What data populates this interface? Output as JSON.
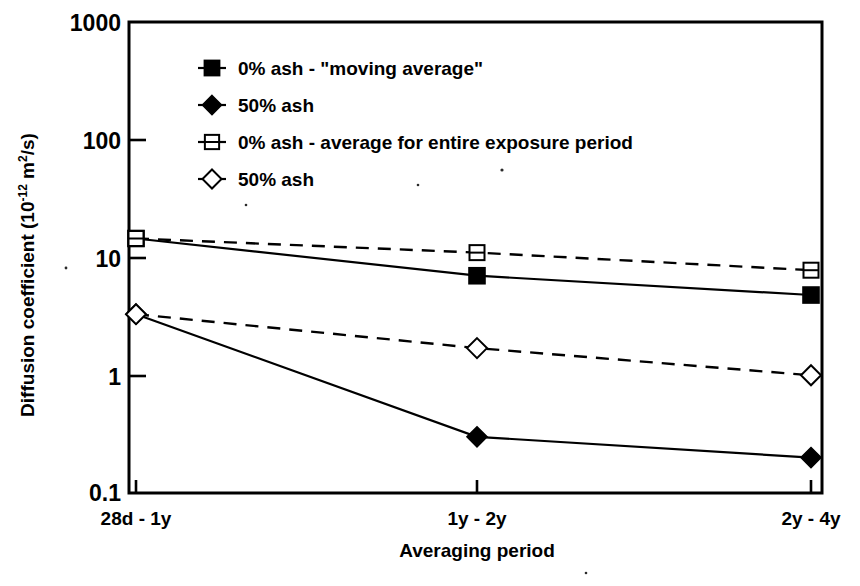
{
  "chart_data": {
    "type": "line",
    "title": "",
    "xlabel": "Averaging period",
    "ylabel": "Diffusion coefficient (10-12 m2/s)",
    "ylabel_parts": {
      "main": "Diffusion coefficient (10",
      "exponent": "-12",
      "mid": " m",
      "exponent2": "2",
      "tail": "/s)"
    },
    "categories": [
      "28d - 1y",
      "1y - 2y",
      "2y - 4y"
    ],
    "yscale": "log",
    "ylim": [
      0.1,
      1000
    ],
    "yticks": [
      "1000",
      "100",
      "10",
      "1",
      "0.1"
    ],
    "ytick_values": [
      1000,
      100,
      10,
      1,
      0.1
    ],
    "grid": false,
    "legend_position": "upper-left-inside",
    "series": [
      {
        "name": "0% ash - \"moving average\"",
        "marker": "filled-square",
        "line": "solid",
        "values": [
          14.5,
          7.0,
          4.8
        ]
      },
      {
        "name": "50% ash",
        "marker": "filled-diamond",
        "line": "solid",
        "values": [
          3.3,
          0.3,
          0.2
        ]
      },
      {
        "name": "0% ash - average for entire exposure period",
        "marker": "open-square",
        "line": "dashed",
        "values": [
          14.5,
          11.0,
          7.8
        ]
      },
      {
        "name": "50% ash",
        "marker": "open-diamond",
        "line": "dashed",
        "values": [
          3.3,
          1.7,
          1.0
        ]
      }
    ]
  },
  "axes": {
    "y_tick_labels": [
      "1000",
      "100",
      "10",
      "1",
      "0.1"
    ],
    "x_tick_labels": [
      "28d - 1y",
      "1y - 2y",
      "2y - 4y"
    ],
    "x_axis_title": "Averaging period"
  },
  "legend": {
    "items": [
      {
        "label": "0% ash - \"moving average\"",
        "marker": "filled-square"
      },
      {
        "label": "50% ash",
        "marker": "filled-diamond"
      },
      {
        "label": "0% ash - average for entire exposure period",
        "marker": "open-square"
      },
      {
        "label": "50% ash",
        "marker": "open-diamond"
      }
    ]
  },
  "colors": {
    "foreground": "#000000",
    "background": "#ffffff"
  }
}
